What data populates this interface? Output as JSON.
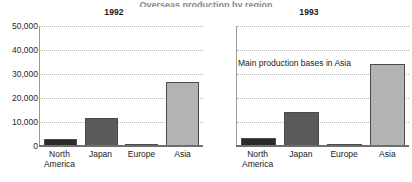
{
  "cut_title": "Overseas production by region",
  "chart_data": {
    "type": "bar",
    "title": "",
    "xlabel": "",
    "ylabel": "",
    "ylim": [
      0,
      50000
    ],
    "yticks": [
      "50,000",
      "40,000",
      "30,000",
      "20,000",
      "10,000",
      "0"
    ],
    "ytick_values": [
      50000,
      40000,
      30000,
      20000,
      10000,
      0
    ],
    "grid": true,
    "legend": "none",
    "categories": [
      "North America",
      "Japan",
      "Europe",
      "Asia"
    ],
    "category_lines": [
      {
        "l1": "North",
        "l2": "America"
      },
      {
        "l1": "Japan",
        "l2": ""
      },
      {
        "l1": "Europe",
        "l2": ""
      },
      {
        "l1": "Asia",
        "l2": ""
      }
    ],
    "colors": [
      "#2b2b2b",
      "#5a5a5a",
      "#fdfdfd",
      "#b3b3b3"
    ],
    "panels": [
      {
        "title": "1992",
        "values": [
          3000,
          11500,
          800,
          26800
        ],
        "annotation": ""
      },
      {
        "title": "1993",
        "values": [
          3200,
          14000,
          700,
          34000
        ],
        "annotation": "Main production bases in Asia"
      }
    ]
  }
}
